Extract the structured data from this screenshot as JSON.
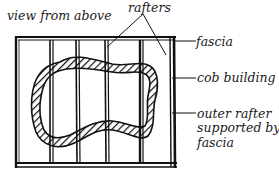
{
  "diagram": {
    "title": "view from above",
    "labels": {
      "rafters": "rafters",
      "fascia": "fascia",
      "cob_building": "cob building",
      "outer_rafter_line1": "outer rafter",
      "outer_rafter_line2": "supported by",
      "outer_rafter_line3": "fascia"
    },
    "colors": {
      "ink": "#111111",
      "background": "#ffffff"
    },
    "elements": {
      "frame": "rectangular fascia frame (plan view)",
      "rafters_count": 4,
      "outer_rafter": "right-hand edge rafter resting on fascia",
      "building": "irregular hatched cob wall outline"
    }
  }
}
